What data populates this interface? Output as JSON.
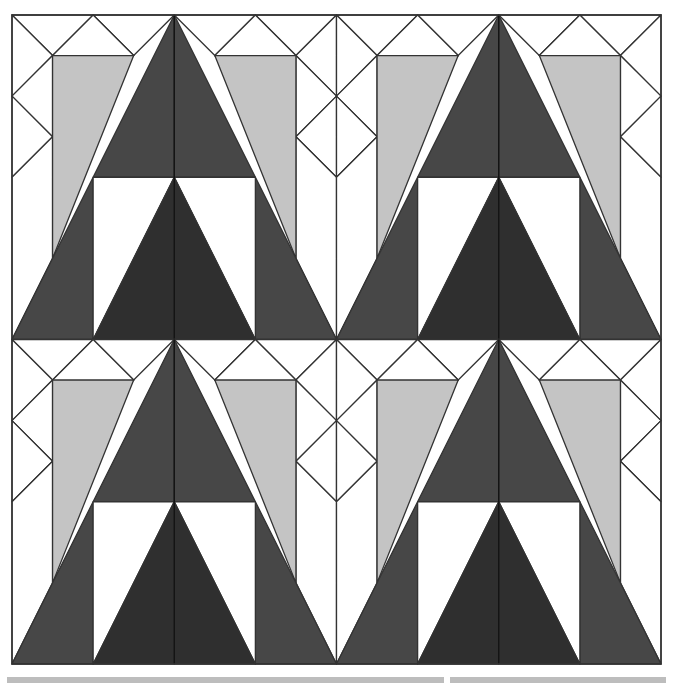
{
  "diagram": {
    "title": "",
    "type": "quilt-block",
    "layout": "2x2 repeat of a 4x4-unit block",
    "colors": {
      "background": "#ffffff",
      "outline": "#333333",
      "light_gray": "#c4c4c4",
      "dark_outer": "#474747",
      "dark_inner": "#2f2f2f"
    },
    "blocks": [
      {
        "row": 0,
        "col": 0
      },
      {
        "row": 0,
        "col": 1
      },
      {
        "row": 1,
        "col": 0
      },
      {
        "row": 1,
        "col": 1
      }
    ],
    "footer_bars": 2
  }
}
